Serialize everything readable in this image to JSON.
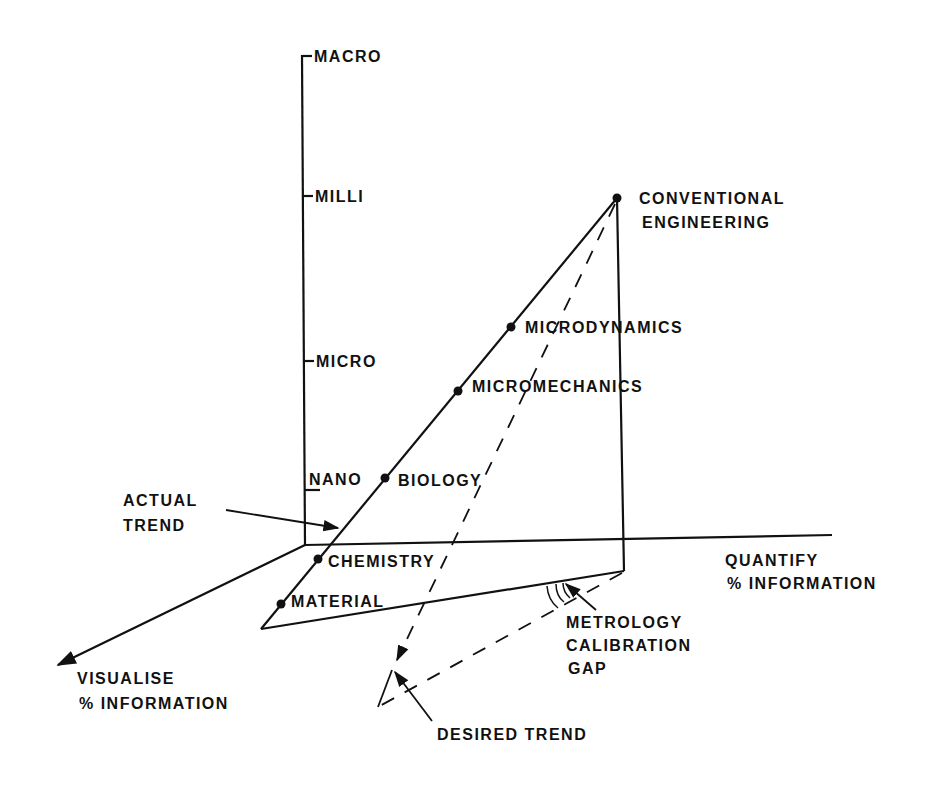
{
  "diagram": {
    "type": "3d-axis-diagram",
    "colors": {
      "ink": "#111111",
      "background": "#ffffff"
    },
    "vertical_axis": {
      "ticks": [
        "MACRO",
        "MILLI",
        "MICRO",
        "NANO"
      ]
    },
    "horizontal_axis": {
      "label_line1": "QUANTIFY",
      "label_line2": "% INFORMATION"
    },
    "depth_axis": {
      "label_line1": "VISUALISE",
      "label_line2": "% INFORMATION"
    },
    "points": [
      {
        "name": "CONVENTIONAL",
        "name2": "ENGINEERING"
      },
      {
        "name": "MICRODYNAMICS"
      },
      {
        "name": "MICROMECHANICS"
      },
      {
        "name": "BIOLOGY"
      },
      {
        "name": "CHEMISTRY"
      },
      {
        "name": "MATERIAL"
      }
    ],
    "annotations": {
      "actual_trend_line1": "ACTUAL",
      "actual_trend_line2": "TREND",
      "gap_line1": "METROLOGY",
      "gap_line2": "CALIBRATION",
      "gap_line3": "GAP",
      "desired_trend": "DESIRED TREND"
    }
  }
}
